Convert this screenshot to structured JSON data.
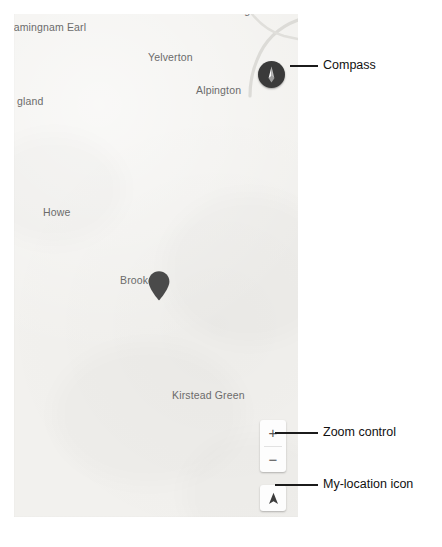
{
  "map": {
    "background_color": "#f2f1ee",
    "place_labels": [
      {
        "name": "Framingham Earl",
        "text": "ramingnam Earl",
        "x": 10,
        "y": 21,
        "clipped": true
      },
      {
        "name": "Halvergate",
        "text": "Halvergate",
        "x": 213,
        "y": 4,
        "clipped": true
      },
      {
        "name": "Yelverton",
        "text": "Yelverton",
        "x": 148,
        "y": 51,
        "clipped": false
      },
      {
        "name": "Alpington",
        "text": "Alpington",
        "x": 196,
        "y": 84,
        "clipped": false
      },
      {
        "name": "Poringland",
        "text": "gland",
        "x": 17,
        "y": 95,
        "clipped": true
      },
      {
        "name": "Howe",
        "text": "Howe",
        "x": 43,
        "y": 206,
        "clipped": false
      },
      {
        "name": "Brooke",
        "text": "Brooke",
        "x": 120,
        "y": 274,
        "clipped": false
      },
      {
        "name": "Kirstead Green",
        "text": "Kirstead Green",
        "x": 172,
        "y": 389,
        "clipped": false
      }
    ],
    "marker": {
      "label": "Brooke",
      "color": "#4a4a4a",
      "x": 133,
      "y": 256
    }
  },
  "controls": {
    "compass": {
      "label": "Compass",
      "color": "#3a3a3a",
      "needle_color": "#ffffff",
      "icon": "compass-needle-icon"
    },
    "zoom": {
      "label": "Zoom control",
      "zoom_in_label": "+",
      "zoom_out_label": "−",
      "background": "#fdfdfd"
    },
    "my_location": {
      "label": "My-location icon",
      "icon": "navigation-arrow-icon",
      "background": "#fdfdfd",
      "arrow_color": "#3c3c3c"
    }
  },
  "annotations": [
    {
      "name": "compass-annotation",
      "label": "Compass",
      "line_x": 290,
      "line_y": 65,
      "line_w": 28,
      "text_x": 323,
      "text_y": 58
    },
    {
      "name": "zoom-annotation",
      "label": "Zoom control",
      "line_x": 275,
      "line_y": 432,
      "line_w": 43,
      "text_x": 323,
      "text_y": 425
    },
    {
      "name": "my-location-annotation",
      "label": "My-location icon",
      "line_x": 275,
      "line_y": 484,
      "line_w": 43,
      "text_x": 323,
      "text_y": 477
    }
  ]
}
